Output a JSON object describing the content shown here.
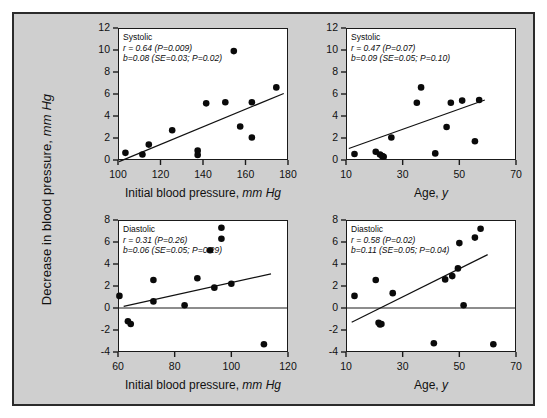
{
  "figure": {
    "background_color": "#cfcfcf",
    "border_color": "#2b2b2b",
    "plot_background": "#ffffff",
    "ylabel_text": "Decrease in blood pressure, ",
    "ylabel_italic": "mm Hg"
  },
  "chart_data": [
    {
      "id": "top-left",
      "type": "scatter",
      "title": "Systolic",
      "annotation_r": "r = 0.64 (P=0.009)",
      "annotation_b": "b=0.08 (SE=0.03; P=0.02)",
      "r": 0.64,
      "r_p": 0.009,
      "slope": 0.08,
      "slope_se": 0.03,
      "slope_p": 0.02,
      "xlabel": "Initial blood pressure, ",
      "xlabel_italic": "mm Hg",
      "ylabel": "Decrease in blood pressure, mm Hg",
      "xlim": [
        100,
        180
      ],
      "ylim": [
        0,
        12
      ],
      "xticks": [
        100,
        120,
        140,
        160,
        180
      ],
      "yticks": [
        0,
        2,
        4,
        6,
        8,
        10,
        12
      ],
      "grid": false,
      "legend": "none",
      "zero_line": false,
      "x": [
        103.5,
        111.5,
        114.5,
        125.5,
        137.5,
        137.5,
        141.5,
        150.5,
        154.5,
        157.5,
        163.0,
        163.0,
        174.5
      ],
      "y": [
        0.65,
        0.5,
        1.4,
        2.7,
        0.85,
        0.45,
        5.15,
        5.25,
        9.9,
        3.05,
        5.25,
        2.05,
        6.6
      ],
      "fit_line": {
        "x0": 100.5,
        "y0": -0.15,
        "x1": 178.0,
        "y1": 6.05
      }
    },
    {
      "id": "top-right",
      "type": "scatter",
      "title": "Systolic",
      "annotation_r": "r = 0.47 (P=0.07)",
      "annotation_b": "b=0.09 (SE=0.05; P=0.10)",
      "r": 0.47,
      "r_p": 0.07,
      "slope": 0.09,
      "slope_se": 0.05,
      "slope_p": 0.1,
      "xlabel": "Age, ",
      "xlabel_italic": "y",
      "ylabel": "Decrease in blood pressure, mm Hg",
      "xlim": [
        10,
        70
      ],
      "ylim": [
        0,
        12
      ],
      "xticks": [
        10,
        30,
        50,
        70
      ],
      "yticks": [
        0,
        2,
        4,
        6,
        8,
        10,
        12
      ],
      "grid": false,
      "legend": "none",
      "zero_line": false,
      "x": [
        13.0,
        20.5,
        22.0,
        22.8,
        23.3,
        26.0,
        35.0,
        36.5,
        41.5,
        45.5,
        47.0,
        51.0,
        55.5,
        57.0
      ],
      "y": [
        0.55,
        0.75,
        0.5,
        0.35,
        0.3,
        2.05,
        5.2,
        6.6,
        0.6,
        3.0,
        5.2,
        5.4,
        1.7,
        5.45
      ],
      "fit_line": {
        "x0": 11.0,
        "y0": 1.05,
        "x1": 59.0,
        "y1": 5.45
      }
    },
    {
      "id": "bottom-left",
      "type": "scatter",
      "title": "Diastolic",
      "annotation_r": "r = 0.31 (P=0.26)",
      "annotation_b": "b=0.06 (SE=0.05; P=0.29)",
      "r": 0.31,
      "r_p": 0.26,
      "slope": 0.06,
      "slope_se": 0.05,
      "slope_p": 0.29,
      "xlabel": "Initial blood pressure, ",
      "xlabel_italic": "mm Hg",
      "ylabel": "Decrease in blood pressure, mm Hg",
      "xlim": [
        60,
        120
      ],
      "ylim": [
        -4,
        8
      ],
      "xticks": [
        60,
        80,
        100,
        120
      ],
      "yticks": [
        -4,
        -2,
        0,
        2,
        4,
        6,
        8
      ],
      "grid": false,
      "legend": "none",
      "zero_line": true,
      "x": [
        60.5,
        63.5,
        64.5,
        72.5,
        72.5,
        83.5,
        88.0,
        92.5,
        94.0,
        96.5,
        96.5,
        100.0,
        111.5
      ],
      "y": [
        1.1,
        -1.2,
        -1.45,
        2.55,
        0.6,
        0.25,
        2.7,
        5.25,
        1.85,
        7.3,
        6.3,
        2.2,
        -3.3
      ],
      "fit_line": {
        "x0": 62.0,
        "y0": 0.15,
        "x1": 114.0,
        "y1": 3.1
      }
    },
    {
      "id": "bottom-right",
      "type": "scatter",
      "title": "Diastolic",
      "annotation_r": "r = 0.58 (P=0.02)",
      "annotation_b": "b=0.11 (SE=0.05; P=0.04)",
      "r": 0.58,
      "r_p": 0.02,
      "slope": 0.11,
      "slope_se": 0.05,
      "slope_p": 0.04,
      "xlabel": "Age, ",
      "xlabel_italic": "y",
      "ylabel": "Decrease in blood pressure, mm Hg",
      "xlim": [
        10,
        70
      ],
      "ylim": [
        -4,
        8
      ],
      "xticks": [
        10,
        30,
        50,
        70
      ],
      "yticks": [
        -4,
        -2,
        0,
        2,
        4,
        6,
        8
      ],
      "grid": false,
      "legend": "none",
      "zero_line": true,
      "x": [
        13.0,
        20.5,
        21.5,
        22.0,
        22.5,
        26.5,
        41.0,
        45.0,
        47.5,
        49.5,
        50.0,
        51.5,
        55.5,
        57.5,
        62.0
      ],
      "y": [
        1.1,
        2.55,
        -1.35,
        -1.5,
        -1.45,
        1.35,
        -3.2,
        2.6,
        2.9,
        3.6,
        5.9,
        0.25,
        6.4,
        7.2,
        -3.3
      ],
      "fit_line": {
        "x0": 12.0,
        "y0": -1.3,
        "x1": 60.0,
        "y1": 4.85
      }
    }
  ]
}
